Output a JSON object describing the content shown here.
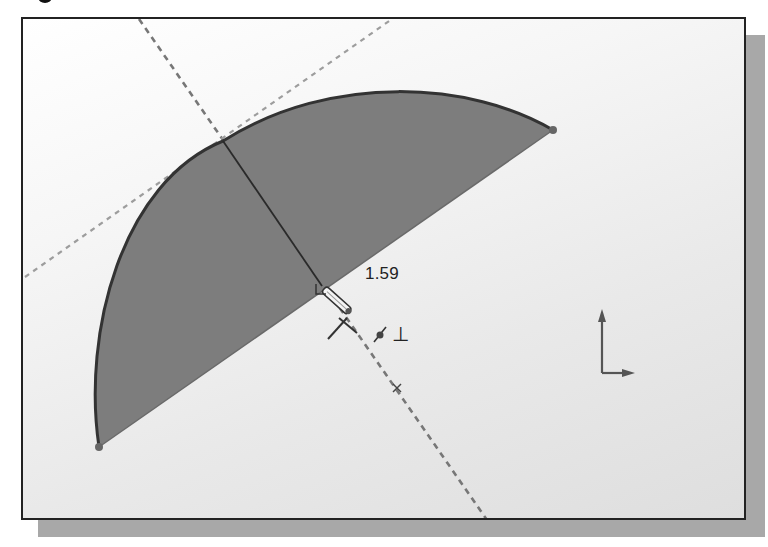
{
  "window": {
    "type": "cad-sketch-viewport"
  },
  "sketch": {
    "dimension_value": "1.59",
    "shape": "semi-circle (arc + chord)",
    "fill_color": "#7d7d7d",
    "outline_color": "#333333",
    "arc_start": [
      97,
      445
    ],
    "arc_end": [
      551,
      128
    ],
    "perpendicular_line": {
      "from": [
        221,
        139
      ],
      "to": [
        320,
        284
      ]
    },
    "construction_lines": [
      {
        "name": "dark-dashed",
        "from": [
          137,
          17
        ],
        "to": [
          485,
          518
        ],
        "color": "#777777"
      },
      {
        "name": "light-dashed",
        "from": [
          23,
          275
        ],
        "to": [
          390,
          17
        ],
        "color": "#9a9a9a"
      }
    ],
    "center_marker": [
      395,
      386
    ]
  },
  "cursor": {
    "icon": "pencil-cursor",
    "inference_icons": [
      "coincident-icon",
      "perpendicular-icon"
    ],
    "perpendicular_symbol": "⊥"
  },
  "triad": {
    "icon": "coordinate-axes-icon"
  }
}
